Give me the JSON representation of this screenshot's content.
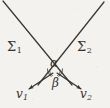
{
  "figure": {
    "background_color": "#f4f2ee",
    "ink_color": "#35322e",
    "width": 110,
    "height": 108,
    "lines": [
      {
        "name": "sigma-1-line",
        "label": "Σ",
        "subscript": "1",
        "x1": 3,
        "y1": 1,
        "x2": 72,
        "y2": 85,
        "description": "descends from upper-left to lower-right through the crossing point"
      },
      {
        "name": "sigma-2-line",
        "label": "Σ",
        "subscript": "2",
        "x1": 104,
        "y1": 2,
        "x2": 38,
        "y2": 85,
        "description": "descends from upper-right to lower-left through the crossing point"
      }
    ],
    "intersection": {
      "name": "crossing-point",
      "x": 55,
      "y": 71
    },
    "angles": [
      {
        "name": "angle-alpha",
        "label": "α",
        "position": "above crossing point, between the two lines",
        "x": 50,
        "y": 57
      },
      {
        "name": "angle-beta",
        "label": "β",
        "position": "below crossing point, between the two velocity vectors",
        "x": 52,
        "y": 77
      }
    ],
    "vectors": [
      {
        "name": "vector-v1",
        "label": "v",
        "subscript": "1",
        "x1": 52,
        "y1": 74,
        "x2": 26,
        "y2": 91,
        "direction": "down-left",
        "arrowhead": true
      },
      {
        "name": "vector-v2",
        "label": "v",
        "subscript": "2",
        "x1": 58,
        "y1": 74,
        "x2": 84,
        "y2": 91,
        "direction": "down-right",
        "arrowhead": true
      }
    ],
    "arc_marks": {
      "name": "angle-arc-marks",
      "count": 2,
      "description": "small hatched angle arcs flanking the crossing point"
    }
  }
}
